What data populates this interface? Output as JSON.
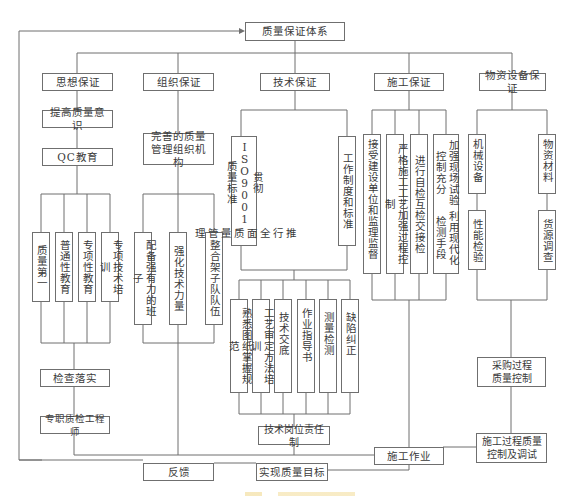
{
  "diagram": {
    "root": {
      "label": "质量保证体系"
    },
    "branches": [
      {
        "id": "thought",
        "label": "思想保证"
      },
      {
        "id": "organization",
        "label": "组织保证"
      },
      {
        "id": "technical",
        "label": "技术保证"
      },
      {
        "id": "construction",
        "label": "施工保证"
      },
      {
        "id": "materials",
        "label": "物资设备保证"
      }
    ],
    "thought": {
      "awareness": "提高质量意识",
      "qc": "QC教育",
      "items": [
        "质量第一",
        "普通性教育",
        "专项性教育",
        "专项技术培训"
      ],
      "inspect": "检查落实",
      "engineer": "专职质检工程师"
    },
    "organization": {
      "structure": "完善的质量管理组织机构",
      "items": [
        "配备强有力的班子",
        "强化技术力量",
        "整合架子队队伍"
      ]
    },
    "technical": {
      "items_top": [
        "贯彻ISO9001质量标准推行全面质量管理",
        "工作制度和标准"
      ],
      "items_top_lines": [
        [
          "贯彻ISO9001质量标准",
          "推行全面质量管理"
        ],
        [
          "工作制度和标准"
        ]
      ],
      "items_bottom": [
        "熟悉图纸掌握规范",
        "工艺审定方法培训",
        "技术交底",
        "作业指导书",
        "测量检测",
        "缺陷纠正"
      ],
      "responsibility": "技术岗位责任制"
    },
    "construction": {
      "items": [
        "接受建设单位和监理监督",
        "严格施工工艺加强过程控制",
        "进行自检互检交接检",
        "加强现场试验控制充分利用现代化检测手段"
      ],
      "items_lines": [
        [
          "接受建设单位和监理监督"
        ],
        [
          "严格施工工艺加强过程控制"
        ],
        [
          "进行自检互检交接检"
        ],
        [
          "加强现场试验控制充分",
          "利用现代化检测手段"
        ]
      ],
      "work": "施工作业"
    },
    "materials": {
      "left_top": "机械设备",
      "left_bottom": "性能检验",
      "right_top": "物资材料",
      "right_bottom": "货源调查",
      "procurement": "采购过程质量控制",
      "procurement_lines": [
        "采购过程",
        "质量控制"
      ],
      "process_control": "施工过程质量控制及调试",
      "process_control_lines": [
        "施工过程质量",
        "控制及调试"
      ]
    },
    "bottom": {
      "feedback": "反馈",
      "goal": "实现质量目标"
    },
    "colors": {
      "line": "#6f6f6f",
      "text": "#3a3a3a",
      "caption": "#f3dfa2"
    }
  }
}
